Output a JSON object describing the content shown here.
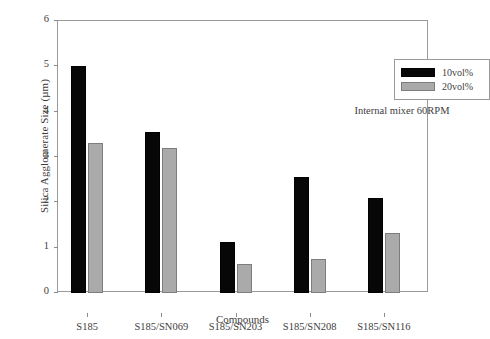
{
  "chart_data": {
    "type": "bar",
    "title": "",
    "xlabel": "Compounds",
    "ylabel": "Silica Agglomerate Size (µm)",
    "categories": [
      "S185",
      "S185/SN069",
      "S185/SN203",
      "S185/SN208",
      "S185/SN116"
    ],
    "series": [
      {
        "name": "10vol%",
        "color": "#070707",
        "values": [
          5.0,
          3.55,
          1.12,
          2.56,
          2.1
        ]
      },
      {
        "name": "20vol%",
        "color": "#aaaaaa",
        "values": [
          3.3,
          3.2,
          0.64,
          0.75,
          1.32
        ]
      }
    ],
    "ylim": [
      0,
      6
    ],
    "yticks": [
      0,
      1,
      2,
      3,
      4,
      5,
      6
    ],
    "ytick_labels": [
      "0",
      "1",
      "2",
      "3",
      "4",
      "5",
      "6"
    ],
    "grid": false,
    "legend_position": "top-right",
    "annotations": [
      "Internal mixer 60RPM"
    ]
  },
  "annotation_text": "Internal mixer 60RPM"
}
